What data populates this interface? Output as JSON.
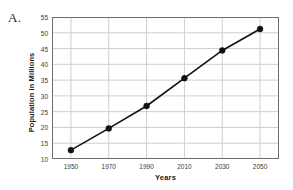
{
  "problem": {
    "label": "A."
  },
  "chart_data": {
    "type": "line",
    "title": "",
    "xlabel": "Years",
    "ylabel": "Population in Millions",
    "x": [
      1950,
      1970,
      1990,
      2010,
      2030,
      2050
    ],
    "categories": [
      "1950",
      "1970",
      "1990",
      "2010",
      "2030",
      "2050"
    ],
    "values": [
      12.8,
      19.7,
      26.8,
      35.6,
      44.4,
      51.2
    ],
    "series": [
      {
        "name": "Population",
        "values": [
          12.8,
          19.7,
          26.8,
          35.6,
          44.4,
          51.2
        ]
      }
    ],
    "xlim": [
      1940,
      2060
    ],
    "ylim": [
      10,
      55
    ],
    "yticks": [
      10,
      15,
      20,
      25,
      30,
      35,
      40,
      45,
      50,
      55
    ],
    "ytick_labels": [
      "10",
      "15",
      "20",
      "25",
      "30",
      "35",
      "40",
      "45",
      "50",
      "55"
    ],
    "xticks": [
      1950,
      1970,
      1990,
      2010,
      2030,
      2050
    ],
    "xtick_labels": [
      "1950",
      "1970",
      "1990",
      "2010",
      "2030",
      "2050"
    ],
    "grid": true,
    "legend": false,
    "marker": "filled-circle",
    "colors": {
      "line": "#111111",
      "marker": "#111111",
      "grid": "#cfcfcf",
      "frame": "#6e6e6e",
      "text": "#2b2b2b"
    }
  }
}
